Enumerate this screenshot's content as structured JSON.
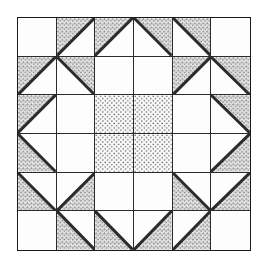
{
  "diagram": {
    "kind": "quilt-block",
    "grid_rows": 6,
    "grid_columns": 6,
    "line_color": "#2b2b2b",
    "background_color": "#ffffff",
    "fabrics": [
      {
        "id": "plain",
        "label": "plain / background",
        "fill": "#fdfdfd"
      },
      {
        "id": "floral",
        "label": "small floral print",
        "fill": "#f2f2f2"
      },
      {
        "id": "heart",
        "label": "heart print",
        "fill": "#fbfbfb"
      }
    ],
    "cells": [
      {
        "r": 1,
        "c": 1,
        "shape": "square",
        "fabric": "plain",
        "corner": ""
      },
      {
        "r": 1,
        "c": 2,
        "shape": "triangle",
        "fabric": "floral",
        "corner": "tl"
      },
      {
        "r": 1,
        "c": 3,
        "shape": "triangle",
        "fabric": "floral",
        "corner": "tl"
      },
      {
        "r": 1,
        "c": 4,
        "shape": "triangle",
        "fabric": "floral",
        "corner": "tr"
      },
      {
        "r": 1,
        "c": 5,
        "shape": "triangle",
        "fabric": "floral",
        "corner": "tr"
      },
      {
        "r": 1,
        "c": 6,
        "shape": "square",
        "fabric": "plain",
        "corner": ""
      },
      {
        "r": 2,
        "c": 1,
        "shape": "triangle",
        "fabric": "floral",
        "corner": "tl"
      },
      {
        "r": 2,
        "c": 2,
        "shape": "triangle",
        "fabric": "floral",
        "corner": "tr"
      },
      {
        "r": 2,
        "c": 3,
        "shape": "square",
        "fabric": "plain",
        "corner": ""
      },
      {
        "r": 2,
        "c": 4,
        "shape": "square",
        "fabric": "plain",
        "corner": ""
      },
      {
        "r": 2,
        "c": 5,
        "shape": "triangle",
        "fabric": "floral",
        "corner": "tl"
      },
      {
        "r": 2,
        "c": 6,
        "shape": "triangle",
        "fabric": "floral",
        "corner": "tr"
      },
      {
        "r": 3,
        "c": 1,
        "shape": "triangle",
        "fabric": "floral",
        "corner": "tl"
      },
      {
        "r": 3,
        "c": 2,
        "shape": "square",
        "fabric": "plain",
        "corner": ""
      },
      {
        "r": 3,
        "c": 3,
        "shape": "square",
        "fabric": "heart",
        "corner": ""
      },
      {
        "r": 3,
        "c": 4,
        "shape": "square",
        "fabric": "heart",
        "corner": ""
      },
      {
        "r": 3,
        "c": 5,
        "shape": "square",
        "fabric": "plain",
        "corner": ""
      },
      {
        "r": 3,
        "c": 6,
        "shape": "triangle",
        "fabric": "floral",
        "corner": "tr"
      },
      {
        "r": 4,
        "c": 1,
        "shape": "triangle",
        "fabric": "floral",
        "corner": "bl"
      },
      {
        "r": 4,
        "c": 2,
        "shape": "square",
        "fabric": "plain",
        "corner": ""
      },
      {
        "r": 4,
        "c": 3,
        "shape": "square",
        "fabric": "heart",
        "corner": ""
      },
      {
        "r": 4,
        "c": 4,
        "shape": "square",
        "fabric": "heart",
        "corner": ""
      },
      {
        "r": 4,
        "c": 5,
        "shape": "square",
        "fabric": "plain",
        "corner": ""
      },
      {
        "r": 4,
        "c": 6,
        "shape": "triangle",
        "fabric": "floral",
        "corner": "br"
      },
      {
        "r": 5,
        "c": 1,
        "shape": "triangle",
        "fabric": "floral",
        "corner": "bl"
      },
      {
        "r": 5,
        "c": 2,
        "shape": "triangle",
        "fabric": "floral",
        "corner": "br"
      },
      {
        "r": 5,
        "c": 3,
        "shape": "square",
        "fabric": "plain",
        "corner": ""
      },
      {
        "r": 5,
        "c": 4,
        "shape": "square",
        "fabric": "plain",
        "corner": ""
      },
      {
        "r": 5,
        "c": 5,
        "shape": "triangle",
        "fabric": "floral",
        "corner": "bl"
      },
      {
        "r": 5,
        "c": 6,
        "shape": "triangle",
        "fabric": "floral",
        "corner": "br"
      },
      {
        "r": 6,
        "c": 1,
        "shape": "square",
        "fabric": "plain",
        "corner": ""
      },
      {
        "r": 6,
        "c": 2,
        "shape": "triangle",
        "fabric": "floral",
        "corner": "bl"
      },
      {
        "r": 6,
        "c": 3,
        "shape": "triangle",
        "fabric": "floral",
        "corner": "bl"
      },
      {
        "r": 6,
        "c": 4,
        "shape": "triangle",
        "fabric": "floral",
        "corner": "br"
      },
      {
        "r": 6,
        "c": 5,
        "shape": "triangle",
        "fabric": "floral",
        "corner": "br"
      },
      {
        "r": 6,
        "c": 6,
        "shape": "square",
        "fabric": "plain",
        "corner": ""
      }
    ]
  }
}
